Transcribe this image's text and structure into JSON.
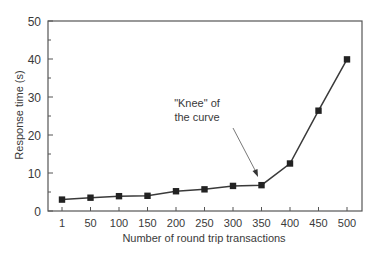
{
  "chart_data": {
    "type": "line",
    "title": "",
    "xlabel": "Number of round trip transactions",
    "ylabel": "Response time (s)",
    "categories": [
      "1",
      "50",
      "100",
      "150",
      "200",
      "250",
      "300",
      "350",
      "400",
      "450",
      "500"
    ],
    "series": [
      {
        "name": "Response time",
        "values": [
          3.0,
          3.5,
          3.9,
          4.0,
          5.2,
          5.7,
          6.6,
          6.8,
          12.5,
          26.4,
          39.9
        ],
        "marker": "square",
        "color": "#2b2b2b"
      }
    ],
    "ylim": [
      0,
      50
    ],
    "yticks": [
      0,
      10,
      20,
      30,
      40,
      50
    ],
    "yminor_ticks": [
      5,
      15,
      25,
      35,
      45
    ],
    "grid": false,
    "legend": null,
    "annotations": [
      {
        "text_lines": [
          "\"Knee\" of",
          "the curve"
        ],
        "points_to_category": "350",
        "arrow": true
      }
    ]
  },
  "colors": {
    "axis": "#555555",
    "line": "#3a3a3a",
    "marker": "#222222",
    "text": "#3a3a3a",
    "background": "#ffffff"
  }
}
